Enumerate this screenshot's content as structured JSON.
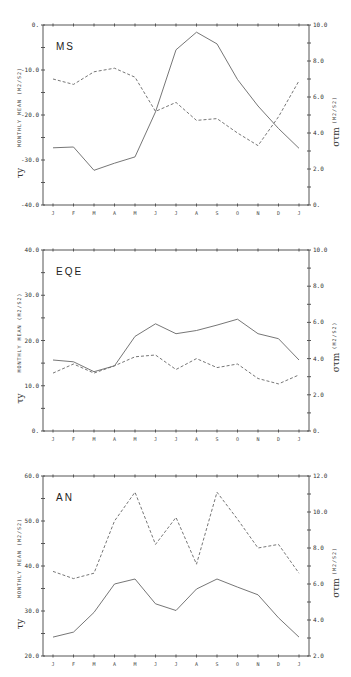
{
  "chart_data": [
    {
      "type": "line",
      "panel_label": "MS",
      "categories": [
        "J",
        "F",
        "M",
        "A",
        "M",
        "J",
        "J",
        "A",
        "S",
        "O",
        "N",
        "D",
        "J"
      ],
      "ylabel_left": "MONTHLY MEAN (M2/S2)",
      "ylabel_left_symbol": "τ^y",
      "ylabel_right": "(M2/S2)",
      "ylabel_right_symbol": "σ_τm",
      "ylim_left": [
        -40,
        0
      ],
      "yticks_left": [
        "0.",
        "-10.0",
        "-20.0",
        "-30.0",
        "-40.0"
      ],
      "ylim_right": [
        0,
        10
      ],
      "yticks_right": [
        "10.0",
        "8.0",
        "6.0",
        "4.0",
        "2.0",
        "0."
      ],
      "series": [
        {
          "name": "monthly mean",
          "style": "solid",
          "axis": "left",
          "values": [
            -27.3,
            -27.1,
            -32.3,
            -30.7,
            -29.3,
            -19.3,
            -5.5,
            -1.6,
            -4.2,
            -12.1,
            -18.0,
            -23.0,
            -27.4
          ]
        },
        {
          "name": "sigma",
          "style": "dashed",
          "axis": "right",
          "values": [
            7.0,
            6.7,
            7.4,
            7.6,
            7.1,
            5.2,
            5.7,
            4.7,
            4.8,
            4.0,
            3.3,
            4.9,
            6.9
          ]
        }
      ]
    },
    {
      "type": "line",
      "panel_label": "EQE",
      "categories": [
        "J",
        "F",
        "M",
        "A",
        "M",
        "J",
        "J",
        "A",
        "S",
        "O",
        "N",
        "D",
        "J"
      ],
      "ylabel_left": "MONTHLY MEAN (M2/S2)",
      "ylabel_left_symbol": "τ^y",
      "ylabel_right": "(M2/S2)",
      "ylabel_right_symbol": "σ_τm",
      "ylim_left": [
        0,
        40
      ],
      "yticks_left": [
        "40.0",
        "30.0",
        "20.0",
        "10.0",
        "0."
      ],
      "ylim_right": [
        0,
        10
      ],
      "yticks_right": [
        "10.0",
        "8.0",
        "6.0",
        "4.0",
        "2.0",
        "0."
      ],
      "series": [
        {
          "name": "monthly mean",
          "style": "solid",
          "axis": "left",
          "values": [
            15.7,
            15.3,
            13.1,
            14.4,
            20.9,
            23.7,
            21.5,
            22.2,
            23.4,
            24.7,
            21.5,
            20.4,
            15.7
          ]
        },
        {
          "name": "sigma",
          "style": "dashed",
          "axis": "right",
          "values": [
            3.2,
            3.7,
            3.2,
            3.6,
            4.1,
            4.2,
            3.4,
            4.0,
            3.5,
            3.7,
            2.9,
            2.6,
            3.1
          ]
        }
      ]
    },
    {
      "type": "line",
      "panel_label": "AN",
      "categories": [
        "J",
        "F",
        "M",
        "A",
        "M",
        "J",
        "J",
        "A",
        "S",
        "O",
        "N",
        "D",
        "J"
      ],
      "ylabel_left": "MONTHLY MEAN (M2/S2)",
      "ylabel_left_symbol": "τ^y",
      "ylabel_right": "(M2/S2)",
      "ylabel_right_symbol": "σ_τm",
      "ylim_left": [
        20,
        60
      ],
      "yticks_left": [
        "60.0",
        "50.0",
        "40.0",
        "30.0",
        "20.0"
      ],
      "ylim_right": [
        2,
        12
      ],
      "yticks_right": [
        "12.0",
        "10.0",
        "8.0",
        "6.0",
        "4.0",
        "2.0"
      ],
      "series": [
        {
          "name": "monthly mean",
          "style": "solid",
          "axis": "left",
          "values": [
            24.2,
            25.3,
            29.7,
            36.0,
            37.1,
            31.6,
            30.1,
            34.9,
            37.1,
            35.3,
            33.6,
            28.5,
            24.2
          ]
        },
        {
          "name": "sigma",
          "style": "dashed",
          "axis": "right",
          "values": [
            6.7,
            6.3,
            6.6,
            9.5,
            11.1,
            8.2,
            9.7,
            7.1,
            11.1,
            9.6,
            8.0,
            8.2,
            6.6
          ]
        }
      ]
    }
  ]
}
